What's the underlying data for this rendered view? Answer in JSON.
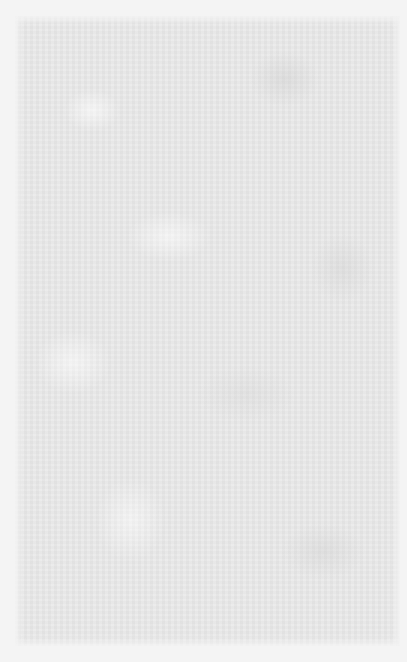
{
  "page": {
    "colors": {
      "border": "#f4f4f4",
      "paper": "#e9e9e9"
    }
  }
}
